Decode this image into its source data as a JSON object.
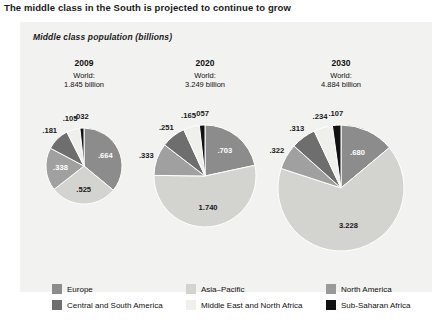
{
  "chart_data": {
    "type": "pie",
    "title": "The middle class in the South is projected to continue to grow",
    "subtitle": "Middle class population (billions)",
    "xlabel": "",
    "ylabel": "",
    "grid": false,
    "legend_position": "bottom",
    "categories": [
      "North America",
      "Asia–Pacific",
      "Europe",
      "Central and South America",
      "Middle East and North Africa",
      "Sub-Saharan Africa"
    ],
    "category_colors": [
      "#8c8c8c",
      "#d3d3d0",
      "#a0a0a0",
      "#6e6e6e",
      "#efefec",
      "#111111"
    ],
    "panels": [
      {
        "year": "2009",
        "world_label": "World:",
        "world_value": "1.845 billion",
        "total": 1.845,
        "radius_px": 38,
        "values": [
          0.664,
          0.525,
          0.338,
          0.181,
          0.105,
          0.032
        ],
        "value_labels": [
          ".664",
          ".525",
          ".338",
          ".181",
          ".105",
          ".032"
        ]
      },
      {
        "year": "2020",
        "world_label": "World:",
        "world_value": "3.249 billion",
        "total": 3.249,
        "radius_px": 51,
        "values": [
          0.703,
          1.74,
          0.333,
          0.251,
          0.165,
          0.057
        ],
        "value_labels": [
          ".703",
          "1.740",
          ".333",
          ".251",
          ".165",
          ".057"
        ]
      },
      {
        "year": "2030",
        "world_label": "World:",
        "world_value": "4.884 billion",
        "total": 4.884,
        "radius_px": 63,
        "values": [
          0.68,
          3.228,
          0.322,
          0.313,
          0.234,
          0.107
        ],
        "value_labels": [
          ".680",
          "3.228",
          ".322",
          ".313",
          ".234",
          ".107"
        ]
      }
    ],
    "legend": [
      {
        "label": "Europe",
        "color": "#8c8c8c"
      },
      {
        "label": "Asia–Pacific",
        "color": "#d3d3d0"
      },
      {
        "label": "North America",
        "color": "#9a9a9a"
      },
      {
        "label": "Central and South America",
        "color": "#6e6e6e"
      },
      {
        "label": "Middle East and North Africa",
        "color": "#efefec"
      },
      {
        "label": "Sub-Saharan Africa",
        "color": "#111111"
      }
    ]
  }
}
